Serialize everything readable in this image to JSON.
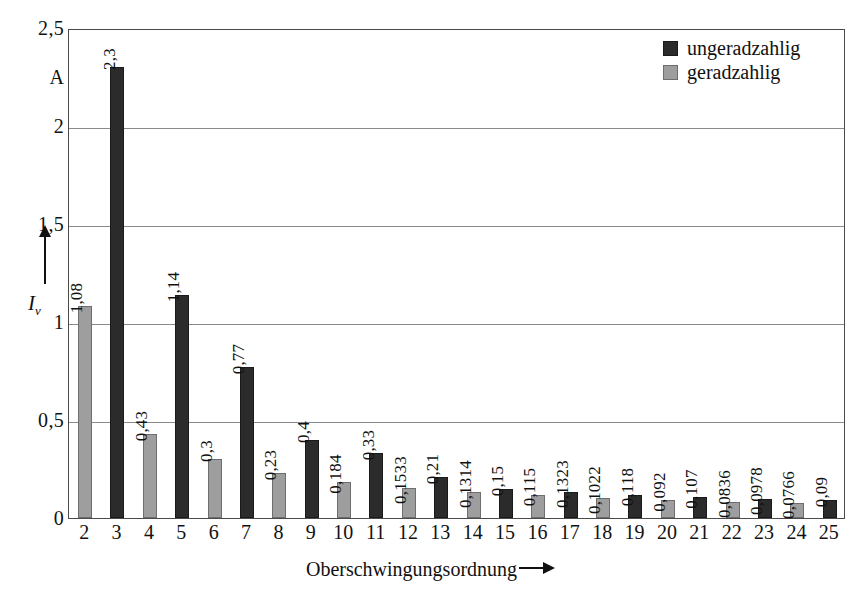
{
  "chart_data": {
    "type": "bar",
    "title": "",
    "xlabel": "Oberschwingungsordnung",
    "ylabel": "I_v",
    "yunit": "A",
    "ylim": [
      0,
      2.5
    ],
    "grid": true,
    "legend_position": "top-right",
    "categories": [
      "2",
      "3",
      "4",
      "5",
      "6",
      "7",
      "8",
      "9",
      "10",
      "11",
      "12",
      "13",
      "14",
      "15",
      "16",
      "17",
      "18",
      "19",
      "20",
      "21",
      "22",
      "23",
      "24",
      "25"
    ],
    "values": [
      1.08,
      2.3,
      0.43,
      1.14,
      0.3,
      0.77,
      0.23,
      0.4,
      0.184,
      0.33,
      0.1533,
      0.21,
      0.1314,
      0.15,
      0.115,
      0.1323,
      0.1022,
      0.118,
      0.092,
      0.107,
      0.0836,
      0.0978,
      0.0766,
      0.09
    ],
    "value_labels": [
      "1,08",
      "2,3",
      "0,43",
      "1,14",
      "0,3",
      "0,77",
      "0,23",
      "0,4",
      "0,184",
      "0,33",
      "0,1533",
      "0,21",
      "0,1314",
      "0,15",
      "0,115",
      "0,1323",
      "0,1022",
      "0,118",
      "0,092",
      "0,107",
      "0,0836",
      "0,0978",
      "0,0766",
      "0,09"
    ],
    "parities": [
      "even",
      "odd",
      "even",
      "odd",
      "even",
      "odd",
      "even",
      "odd",
      "even",
      "odd",
      "even",
      "odd",
      "even",
      "odd",
      "even",
      "odd",
      "even",
      "odd",
      "even",
      "odd",
      "even",
      "odd",
      "even",
      "odd"
    ],
    "y_ticks": [
      "0",
      "0,5",
      "1",
      "1,5",
      "2",
      "2,5"
    ],
    "y_tick_values": [
      0,
      0.5,
      1,
      1.5,
      2,
      2.5
    ],
    "series": [
      {
        "name": "ungeradzahlig",
        "color": "#2b2b2b"
      },
      {
        "name": "geradzahlig",
        "color": "#9e9e9e"
      }
    ]
  },
  "axis": {
    "y_title_main": "I",
    "y_title_sub": "v",
    "y_unit_label": "A",
    "x_title": "Oberschwingungsordnung"
  },
  "legend": {
    "items": [
      {
        "label": "ungeradzahlig",
        "parity": "odd"
      },
      {
        "label": "geradzahlig",
        "parity": "even"
      }
    ]
  }
}
